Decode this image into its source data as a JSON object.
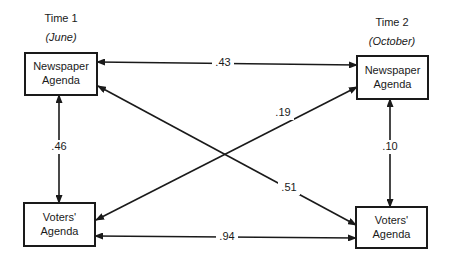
{
  "columns": [
    {
      "time": "Time 1",
      "period": "(June)"
    },
    {
      "time": "Time 2",
      "period": "(October)"
    }
  ],
  "nodes": {
    "np1": {
      "line1": "Newspaper",
      "line2": "Agenda"
    },
    "v1": {
      "line1": "Voters'",
      "line2": "Agenda"
    },
    "np2": {
      "line1": "Newspaper",
      "line2": "Agenda"
    },
    "v2": {
      "line1": "Voters'",
      "line2": "Agenda"
    }
  },
  "edges": [
    {
      "id": "np1-np2",
      "from": "np1",
      "to": "np2",
      "label": ".43"
    },
    {
      "id": "np1-v1",
      "from": "np1",
      "to": "v1",
      "label": ".46"
    },
    {
      "id": "np2-v2",
      "from": "np2",
      "to": "v2",
      "label": ".10"
    },
    {
      "id": "v1-v2",
      "from": "v1",
      "to": "v2",
      "label": ".94"
    },
    {
      "id": "v1-np2",
      "from": "v1",
      "to": "np2",
      "label": ".19"
    },
    {
      "id": "np1-v2",
      "from": "np1",
      "to": "v2",
      "label": ".51"
    }
  ],
  "colors": {
    "ink": "#1a1a1a",
    "background": "#ffffff"
  }
}
